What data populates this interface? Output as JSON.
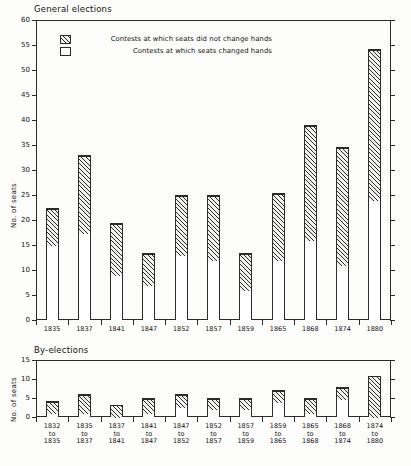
{
  "figure": {
    "panels": [
      {
        "title": "General elections",
        "ylabel": "No. of seats"
      },
      {
        "title": "By-elections",
        "ylabel": "No. of seats"
      }
    ],
    "legend": [
      {
        "label": "Contests at which seats did not change hands",
        "swatch": "hatched"
      },
      {
        "label": "Contests at which seats changed hands",
        "swatch": "white"
      }
    ]
  },
  "chart_data": [
    {
      "type": "bar",
      "title": "General elections",
      "stacked": true,
      "xlabel": "",
      "ylabel": "No. of seats",
      "ylim": [
        0,
        60
      ],
      "yticks": [
        0,
        5,
        10,
        15,
        20,
        25,
        30,
        35,
        40,
        45,
        50,
        55,
        60
      ],
      "grid": false,
      "legend_position": "top-center",
      "categories": [
        "1835",
        "1837",
        "1841",
        "1847",
        "1852",
        "1857",
        "1859",
        "1865",
        "1868",
        "1874",
        "1880"
      ],
      "series": [
        {
          "name": "Contests at which seats changed hands",
          "style": "white",
          "values": [
            15,
            17.5,
            9,
            7,
            13,
            12,
            6,
            12,
            16,
            11,
            24
          ]
        },
        {
          "name": "Contests at which seats did not change hands",
          "style": "hatched",
          "values": [
            7.5,
            15.5,
            10.5,
            6.5,
            12,
            13,
            7.5,
            13.5,
            23,
            23.7,
            30.3
          ]
        }
      ],
      "totals": [
        22.5,
        33,
        19.5,
        13.5,
        25,
        25,
        13.5,
        25.5,
        39,
        34.7,
        54.3
      ]
    },
    {
      "type": "bar",
      "title": "By-elections",
      "stacked": true,
      "xlabel": "",
      "ylabel": "No. of seats",
      "ylim": [
        0,
        15
      ],
      "yticks": [
        0,
        5,
        10,
        15
      ],
      "grid": false,
      "categories": [
        "1832\nto\n1835",
        "1835\nto\n1837",
        "1837\nto\n1841",
        "1841\nto\n1847",
        "1847\nto\n1852",
        "1852\nto\n1857",
        "1857\nto\n1859",
        "1859\nto\n1865",
        "1865\nto\n1868",
        "1868\nto\n1874",
        "1874\nto\n1880"
      ],
      "series": [
        {
          "name": "Contests at which seats changed hands",
          "style": "white",
          "values": [
            1,
            1,
            0,
            1,
            2.7,
            2,
            2,
            4,
            1,
            4.8,
            0
          ]
        },
        {
          "name": "Contests at which seats did not change hands",
          "style": "hatched",
          "values": [
            3.1,
            5,
            3.1,
            4,
            3.3,
            3,
            3,
            3,
            4,
            3.1,
            10.7
          ]
        }
      ],
      "totals": [
        4.1,
        6,
        3.1,
        5,
        6,
        5,
        5,
        7,
        5,
        7.9,
        10.7
      ]
    }
  ]
}
